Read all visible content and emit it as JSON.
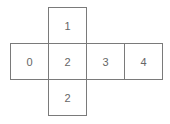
{
  "diagram": {
    "type": "cube-net",
    "cells": [
      {
        "label": "1",
        "row": 0,
        "col": 1
      },
      {
        "label": "0",
        "row": 1,
        "col": 0
      },
      {
        "label": "2",
        "row": 1,
        "col": 1
      },
      {
        "label": "3",
        "row": 1,
        "col": 2
      },
      {
        "label": "4",
        "row": 1,
        "col": 3
      },
      {
        "label": "2",
        "row": 2,
        "col": 1
      }
    ]
  },
  "colors": {
    "border": "#7a7a7a",
    "text": "#666666",
    "background": "#ffffff"
  }
}
